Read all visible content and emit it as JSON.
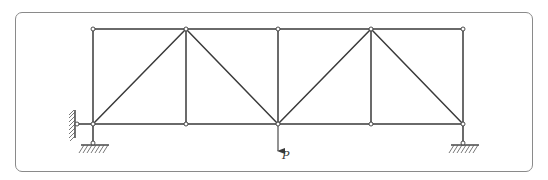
{
  "diagram": {
    "type": "plane truss",
    "panels": 4,
    "nodes": {
      "top": [
        {
          "id": "T0",
          "x": 93,
          "y": 29
        },
        {
          "id": "T1",
          "x": 186,
          "y": 29
        },
        {
          "id": "T2",
          "x": 278,
          "y": 29
        },
        {
          "id": "T3",
          "x": 371,
          "y": 29
        },
        {
          "id": "T4",
          "x": 463,
          "y": 29
        }
      ],
      "bottom": [
        {
          "id": "B0",
          "x": 93,
          "y": 124
        },
        {
          "id": "B1",
          "x": 186,
          "y": 124
        },
        {
          "id": "B2",
          "x": 278,
          "y": 124
        },
        {
          "id": "B3",
          "x": 371,
          "y": 124
        },
        {
          "id": "B4",
          "x": 463,
          "y": 124
        }
      ]
    },
    "members": [
      [
        "T0",
        "T1"
      ],
      [
        "T1",
        "T2"
      ],
      [
        "T2",
        "T3"
      ],
      [
        "T3",
        "T4"
      ],
      [
        "B0",
        "B1"
      ],
      [
        "B1",
        "B2"
      ],
      [
        "B2",
        "B3"
      ],
      [
        "B3",
        "B4"
      ],
      [
        "T0",
        "B0"
      ],
      [
        "T1",
        "B1"
      ],
      [
        "T2",
        "B2"
      ],
      [
        "T3",
        "B3"
      ],
      [
        "T4",
        "B4"
      ],
      [
        "B0",
        "T1"
      ],
      [
        "T1",
        "B2"
      ],
      [
        "B2",
        "T3"
      ],
      [
        "T3",
        "B4"
      ]
    ],
    "supports": [
      {
        "name": "left-wall-support",
        "node": "B0",
        "type": "pin-to-wall",
        "direction": "horizontal"
      },
      {
        "name": "left-ground-support",
        "node": "B0",
        "type": "pin-to-ground",
        "direction": "vertical"
      },
      {
        "name": "right-ground-support",
        "node": "B4",
        "type": "pin-to-ground",
        "direction": "vertical"
      }
    ],
    "loads": [
      {
        "node": "B2",
        "direction": "down",
        "label": "P"
      }
    ]
  }
}
